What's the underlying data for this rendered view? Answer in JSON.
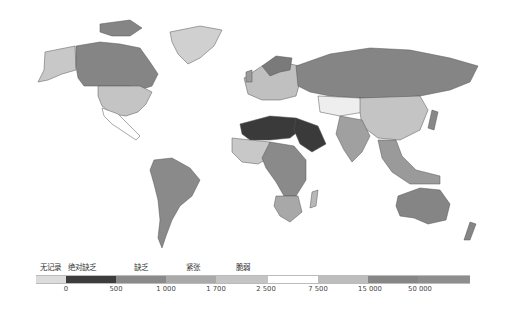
{
  "legend": {
    "categories": [
      {
        "label": "无记录",
        "x": 40
      },
      {
        "label": "绝对缺乏",
        "x": 68
      },
      {
        "label": "缺乏",
        "x": 134
      },
      {
        "label": "紧张",
        "x": 186
      },
      {
        "label": "脆弱",
        "x": 236
      }
    ],
    "segments": [
      {
        "from": 36,
        "to": 66,
        "color": "#dcdcdc"
      },
      {
        "from": 66,
        "to": 116,
        "color": "#3c3c3c"
      },
      {
        "from": 116,
        "to": 166,
        "color": "#8a8a8a"
      },
      {
        "from": 166,
        "to": 216,
        "color": "#a9a9a9"
      },
      {
        "from": 216,
        "to": 268,
        "color": "#c4c4c4"
      },
      {
        "from": 268,
        "to": 318,
        "color": "#ffffff"
      },
      {
        "from": 318,
        "to": 368,
        "color": "#bdbdbd"
      },
      {
        "from": 368,
        "to": 418,
        "color": "#868686"
      },
      {
        "from": 418,
        "to": 470,
        "color": "#8e8e8e"
      }
    ],
    "ticks": [
      {
        "label": "0",
        "x": 66
      },
      {
        "label": "500",
        "x": 116
      },
      {
        "label": "1 000",
        "x": 166
      },
      {
        "label": "1 700",
        "x": 216
      },
      {
        "label": "2 500",
        "x": 266
      },
      {
        "label": "7 500",
        "x": 318
      },
      {
        "label": "15 000",
        "x": 370
      },
      {
        "label": "50 000",
        "x": 420
      }
    ]
  },
  "map": {
    "colors": {
      "no_record": "#dcdcdc",
      "absolute_scarcity": "#3c3c3c",
      "scarcity": "#8a8a8a",
      "stress": "#a9a9a9",
      "vulnerable": "#c4c4c4",
      "mid": "#ffffff",
      "high": "#bdbdbd",
      "very_high": "#868686",
      "border": "#555555"
    },
    "regions": [
      {
        "name": "alaska",
        "fill": "#c8c8c8",
        "d": "M45,52 L75,46 L76,70 L62,74 L48,80 L38,82 L44,70 Z"
      },
      {
        "name": "canada",
        "fill": "#858585",
        "d": "M76,46 L100,42 L120,44 L140,48 L150,62 L158,74 L152,86 L140,90 L130,86 L118,86 L100,86 L84,86 L78,78 L76,66 Z"
      },
      {
        "name": "canada-islands",
        "fill": "#858585",
        "d": "M100,24 L130,20 L142,28 L130,36 L112,36 L100,32 Z"
      },
      {
        "name": "greenland",
        "fill": "#d0d0d0",
        "d": "M170,32 L200,26 L222,30 L214,46 L200,58 L188,64 L178,54 L172,42 Z"
      },
      {
        "name": "usa",
        "fill": "#c4c4c4",
        "d": "M98,86 L140,86 L152,92 L146,104 L138,112 L126,116 L112,114 L102,106 L98,96 Z"
      },
      {
        "name": "mexico-central-america",
        "fill": "#ffffff",
        "d": "M102,108 L118,114 L128,124 L140,136 L136,140 L124,132 L112,124 L104,116 Z"
      },
      {
        "name": "south-america",
        "fill": "#8a8a8a",
        "d": "M154,160 L172,158 L190,168 L200,180 L192,196 L180,206 L172,220 L166,236 L162,248 L158,238 L160,220 L158,200 L154,184 L150,170 Z"
      },
      {
        "name": "europe",
        "fill": "#c0c0c0",
        "d": "M244,78 L262,66 L280,62 L300,66 L300,82 L296,96 L280,100 L262,100 L248,94 Z"
      },
      {
        "name": "scandinavia",
        "fill": "#7a7a7a",
        "d": "M262,66 L276,56 L292,58 L290,70 L280,72 L270,76 Z"
      },
      {
        "name": "russia",
        "fill": "#858585",
        "d": "M296,66 L330,54 L370,48 L410,50 L450,58 L478,66 L470,82 L450,90 L420,96 L390,98 L360,98 L330,96 L310,92 L298,86 Z"
      },
      {
        "name": "central-asia",
        "fill": "#eeeeee",
        "d": "M318,96 L360,98 L364,112 L340,116 L320,112 Z"
      },
      {
        "name": "china-mongolia",
        "fill": "#c4c4c4",
        "d": "M360,98 L420,96 L428,110 L420,130 L400,140 L378,138 L362,126 L360,112 Z"
      },
      {
        "name": "india-south-asia",
        "fill": "#a0a0a0",
        "d": "M340,116 L362,120 L370,136 L362,152 L352,162 L344,150 L336,134 Z"
      },
      {
        "name": "north-africa",
        "fill": "#3a3a3a",
        "d": "M240,124 L270,116 L296,118 L300,130 L290,138 L270,140 L250,140 L242,134 Z"
      },
      {
        "name": "arabia",
        "fill": "#3a3a3a",
        "d": "M296,118 L318,126 L326,144 L312,152 L300,144 L294,130 Z"
      },
      {
        "name": "west-africa",
        "fill": "#c8c8c8",
        "d": "M232,138 L250,140 L270,142 L272,156 L258,164 L242,162 L232,152 Z"
      },
      {
        "name": "central-africa",
        "fill": "#8a8a8a",
        "d": "M270,142 L294,146 L306,160 L306,180 L296,196 L284,196 L276,182 L266,168 L262,158 Z"
      },
      {
        "name": "southern-africa",
        "fill": "#a8a8a8",
        "d": "M276,196 L298,196 L302,212 L290,222 L280,216 L274,206 Z"
      },
      {
        "name": "madagascar",
        "fill": "#b8b8b8",
        "d": "M312,192 L318,190 L316,206 L310,208 Z"
      },
      {
        "name": "southeast-asia",
        "fill": "#9a9a9a",
        "d": "M378,140 L396,140 L402,156 L416,170 L440,176 L440,184 L410,184 L392,172 L382,158 Z"
      },
      {
        "name": "japan",
        "fill": "#888888",
        "d": "M432,110 L438,112 L434,130 L428,128 Z"
      },
      {
        "name": "australia",
        "fill": "#858585",
        "d": "M398,196 L420,188 L440,190 L450,204 L446,220 L428,224 L414,218 L400,216 L396,206 Z"
      },
      {
        "name": "new-zealand",
        "fill": "#858585",
        "d": "M470,222 L476,224 L470,240 L464,240 Z"
      },
      {
        "name": "uk-iceland",
        "fill": "#9a9a9a",
        "d": "M246,72 L252,70 L252,82 L246,82 Z"
      }
    ]
  }
}
